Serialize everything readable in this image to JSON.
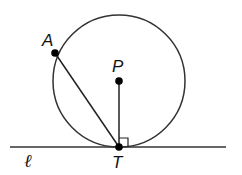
{
  "diagram": {
    "labels": {
      "point_a": "A",
      "center_p": "P",
      "tangent_point": "T",
      "line": "ℓ"
    },
    "colors": {
      "stroke": "#333333",
      "point": "#000000",
      "background": "#ffffff"
    },
    "elements": {
      "circle": {
        "center": "P",
        "description": "circle with center P"
      },
      "chord": "AT",
      "radius": "PT",
      "tangent_line": "ℓ tangent to circle at T",
      "right_angle_marker": "at T between PT and ℓ"
    }
  }
}
